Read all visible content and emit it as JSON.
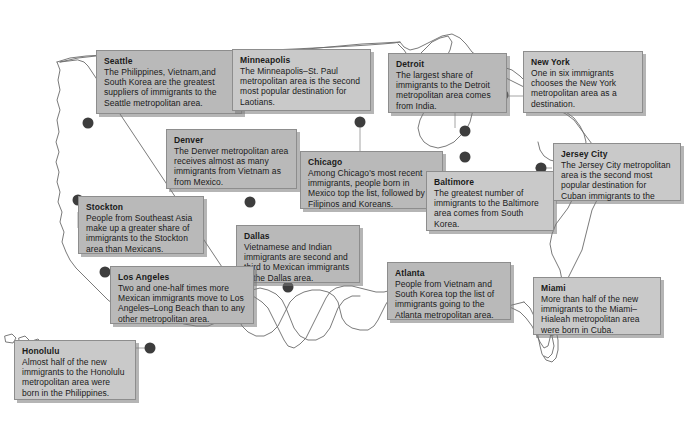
{
  "map": {
    "title": "Immigrant Destinations by Metropolitan Area",
    "region": "United States",
    "colors": {
      "callout_fill": "#b9b9b9",
      "callout_border": "#8d8d8d",
      "dot": "#3d3d3d",
      "outline": "#6b6b6b",
      "background": "#ffffff"
    }
  },
  "callouts": [
    {
      "id": "seattle",
      "city": "Seattle",
      "text": "The Philippines, Vietnam,and South Korea are the greatest suppliers of immigrants to the Seattle metropolitan area."
    },
    {
      "id": "minneapolis",
      "city": "Minneapolis",
      "text": "The Minneapolis–St. Paul metropolitan area is the second most popular destination for Laotians."
    },
    {
      "id": "detroit",
      "city": "Detroit",
      "text": "The largest share of immigrants to the Detroit metropolitan area comes from India."
    },
    {
      "id": "newyork",
      "city": "New York",
      "text": "One in six immigrants chooses the New York metropolitan area as a destination."
    },
    {
      "id": "denver",
      "city": "Denver",
      "text": "The Denver metropolitan area receives almost as many immigrants from Vietnam as from Mexico."
    },
    {
      "id": "chicago",
      "city": "Chicago",
      "text": "Among Chicago's most recent immigrants, people born in Mexico top the list, followed by Filipinos and Koreans."
    },
    {
      "id": "baltimore",
      "city": "Baltimore",
      "text": "The greatest number of immigrants to the Baltimore area comes from South Korea."
    },
    {
      "id": "jerseycity",
      "city": "Jersey City",
      "text": "The Jersey City metropolitan area is the second most popular destination for Cuban immigrants to the"
    },
    {
      "id": "stockton",
      "city": "Stockton",
      "text": "People from Southeast Asia make up a greater share of immigrants to the Stockton area than Mexicans."
    },
    {
      "id": "dallas",
      "city": "Dallas",
      "text": "Vietnamese and Indian immigrants are second and third to Mexican immigrants in the Dallas area."
    },
    {
      "id": "losangeles",
      "city": "Los Angeles",
      "text": "Two and one-half times more Mexican immigrants move to Los Angeles–Long Beach than to any other metropolitan area."
    },
    {
      "id": "atlanta",
      "city": "Atlanta",
      "text": "People from Vietnam and South Korea top the list of immigrants going to the Atlanta metropolitan area."
    },
    {
      "id": "miami",
      "city": "Miami",
      "text": "More than half of the new immigrants to the Miami–Hialeah metropolitan area were born in Cuba."
    },
    {
      "id": "honolulu",
      "city": "Honolulu",
      "text": "Almost half of the new immigrants to the Honolulu metropolitan area were born in the Philippines."
    }
  ],
  "markers": [
    {
      "id": "seattle-dot",
      "label": "Seattle"
    },
    {
      "id": "minneapolis-dot",
      "label": "Minneapolis"
    },
    {
      "id": "denver-dot",
      "label": "Denver"
    },
    {
      "id": "chicago-dot",
      "label": "Chicago"
    },
    {
      "id": "detroit-dot",
      "label": "Detroit"
    },
    {
      "id": "newyork-dot",
      "label": "New York"
    },
    {
      "id": "jerseycity-dot",
      "label": "Jersey City"
    },
    {
      "id": "baltimore-dot",
      "label": "Baltimore"
    },
    {
      "id": "stockton-dot",
      "label": "Stockton"
    },
    {
      "id": "losangeles-dot",
      "label": "Los Angeles"
    },
    {
      "id": "dallas-dot",
      "label": "Dallas"
    },
    {
      "id": "atlanta-dot",
      "label": "Atlanta"
    },
    {
      "id": "miami-dot",
      "label": "Miami"
    },
    {
      "id": "honolulu-dot",
      "label": "Honolulu"
    }
  ]
}
